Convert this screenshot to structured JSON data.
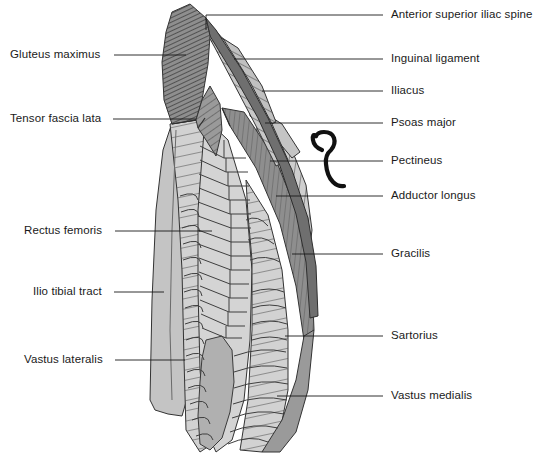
{
  "figure": {
    "width": 533,
    "height": 464,
    "background_color": "#ffffff",
    "line_color": "#1a1a1a",
    "palette": {
      "light_gray": "#d2d2d2",
      "mid_gray": "#b5b5b5",
      "dark_gray": "#8e8e8e",
      "darker_gray": "#7a7a7a",
      "outline": "#333333",
      "hatch_line": "#4a4a4a"
    }
  },
  "labels_left": [
    {
      "id": "gluteus-maximus",
      "text": "Gluteus maximus",
      "text_x": 10,
      "text_y": 49,
      "leader": {
        "x1": 114,
        "y1": 55,
        "x2": 186,
        "y2": 55
      }
    },
    {
      "id": "tensor-fascia-lata",
      "text": "Tensor fascia lata",
      "text_x": 10,
      "text_y": 113,
      "leader": {
        "x1": 113,
        "y1": 119,
        "x2": 196,
        "y2": 119
      }
    },
    {
      "id": "rectus-femoris",
      "text": "Rectus femoris",
      "text_x": 24,
      "text_y": 225,
      "leader": {
        "x1": 115,
        "y1": 231,
        "x2": 212,
        "y2": 231
      }
    },
    {
      "id": "ilio-tibial-tract",
      "text": "Ilio tibial tract",
      "text_x": 33,
      "text_y": 286,
      "leader": {
        "x1": 114,
        "y1": 292,
        "x2": 164,
        "y2": 292
      }
    },
    {
      "id": "vastus-lateralis",
      "text": "Vastus lateralis",
      "text_x": 24,
      "text_y": 354,
      "leader": {
        "x1": 115,
        "y1": 360,
        "x2": 185,
        "y2": 360
      }
    }
  ],
  "labels_right": [
    {
      "id": "anterior-superior-iliac-spine",
      "text": "Anterior superior iliac spine",
      "text_x": 391,
      "text_y": 9,
      "leader": {
        "x1": 383,
        "y1": 15,
        "x2": 206,
        "y2": 15
      },
      "elbow": {
        "x": 206,
        "y": 15,
        "y2": 30
      }
    },
    {
      "id": "inguinal-ligament",
      "text": "Inguinal ligament",
      "text_x": 391,
      "text_y": 53,
      "leader": {
        "x1": 383,
        "y1": 59,
        "x2": 234,
        "y2": 59
      }
    },
    {
      "id": "iliacus",
      "text": "Iliacus",
      "text_x": 391,
      "text_y": 85,
      "leader": {
        "x1": 383,
        "y1": 91,
        "x2": 262,
        "y2": 91
      }
    },
    {
      "id": "psoas-major",
      "text": "Psoas major",
      "text_x": 391,
      "text_y": 117,
      "leader": {
        "x1": 383,
        "y1": 123,
        "x2": 265,
        "y2": 123
      }
    },
    {
      "id": "pectineus",
      "text": "Pectineus",
      "text_x": 391,
      "text_y": 155,
      "leader": {
        "x1": 383,
        "y1": 161,
        "x2": 270,
        "y2": 161
      }
    },
    {
      "id": "adductor-longus",
      "text": "Adductor longus",
      "text_x": 391,
      "text_y": 190,
      "leader": {
        "x1": 383,
        "y1": 196,
        "x2": 276,
        "y2": 196
      }
    },
    {
      "id": "gracilis",
      "text": "Gracilis",
      "text_x": 391,
      "text_y": 248,
      "leader": {
        "x1": 383,
        "y1": 254,
        "x2": 292,
        "y2": 254
      }
    },
    {
      "id": "sartorius",
      "text": "Sartorius",
      "text_x": 391,
      "text_y": 330,
      "leader": {
        "x1": 383,
        "y1": 336,
        "x2": 285,
        "y2": 336
      }
    },
    {
      "id": "vastus-medialis",
      "text": "Vastus medialis",
      "text_x": 391,
      "text_y": 390,
      "leader": {
        "x1": 383,
        "y1": 396,
        "x2": 277,
        "y2": 396
      }
    }
  ],
  "anatomy_regions": [
    {
      "id": "gluteus-maximus-region",
      "name": "Gluteus maximus",
      "fill": "#8e8e8e",
      "hatch": "diagonal-dense"
    },
    {
      "id": "tensor-fascia-lata-region",
      "name": "Tensor fascia lata",
      "fill": "#9a9a9a",
      "hatch": "diagonal"
    },
    {
      "id": "ilio-tibial-tract-region",
      "name": "Ilio tibial tract",
      "fill": "#c2c2c2",
      "hatch": "none"
    },
    {
      "id": "vastus-lateralis-region",
      "name": "Vastus lateralis",
      "fill": "#d2d2d2",
      "hatch": "transverse"
    },
    {
      "id": "rectus-femoris-region",
      "name": "Rectus femoris",
      "fill": "#d2d2d2",
      "hatch": "chevron"
    },
    {
      "id": "vastus-medialis-region",
      "name": "Vastus medialis",
      "fill": "#d2d2d2",
      "hatch": "transverse"
    },
    {
      "id": "sartorius-region",
      "name": "Sartorius",
      "fill": "#8e8e8e",
      "hatch": "longitudinal"
    },
    {
      "id": "gracilis-region",
      "name": "Gracilis",
      "fill": "#b5b5b5",
      "hatch": "longitudinal"
    },
    {
      "id": "adductor-longus-region",
      "name": "Adductor longus",
      "fill": "#c8c8c8",
      "hatch": "longitudinal"
    },
    {
      "id": "pectineus-region",
      "name": "Pectineus",
      "fill": "#c0c0c0",
      "hatch": "longitudinal"
    },
    {
      "id": "psoas-major-region",
      "name": "Psoas major",
      "fill": "#bdbdbd",
      "hatch": "diagonal"
    },
    {
      "id": "iliacus-region",
      "name": "Iliacus",
      "fill": "#c6c6c6",
      "hatch": "diagonal"
    },
    {
      "id": "inguinal-ligament-region",
      "name": "Inguinal ligament",
      "fill": "#7a7a7a",
      "hatch": "none"
    },
    {
      "id": "patella-region",
      "name": "Patella",
      "fill": "#b0b0b0",
      "hatch": "none"
    }
  ],
  "bracket": {
    "id": "pectineus-bracket",
    "description": "curly bracket marking pectineus",
    "x": 312,
    "y": 130,
    "width": 34,
    "height": 58
  }
}
